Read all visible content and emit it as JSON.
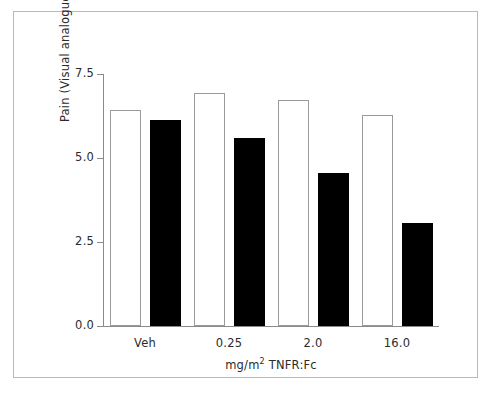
{
  "chart_data": {
    "type": "bar",
    "title": "",
    "subtitle": "",
    "xlabel_prefix": "mg/m",
    "xlabel_sup": "2",
    "xlabel_suffix": " TNFR:Fc",
    "xlabel": "mg/m2 TNFR:Fc",
    "ylabel": "Pain (Visual analogue)",
    "categories": [
      "Veh",
      "0.25",
      "2.0",
      "16.0"
    ],
    "ylim": [
      0.0,
      7.5
    ],
    "yticks": [
      0.0,
      2.5,
      5.0,
      7.5
    ],
    "ytick_labels": [
      "0.0",
      "2.5",
      "5.0",
      "7.5"
    ],
    "grid": false,
    "legend": "none",
    "series": [
      {
        "name": "open",
        "fill": "#ffffff",
        "edge": "#9a9a9a",
        "values": [
          6.43,
          6.93,
          6.73,
          6.28
        ]
      },
      {
        "name": "filled",
        "fill": "#000000",
        "edge": "#000000",
        "values": [
          6.13,
          5.6,
          4.55,
          3.07
        ]
      }
    ]
  },
  "figure": {
    "frame_color": "#b9b9b9",
    "axis_color": "#8a8a8a",
    "background": "#ffffff",
    "text_color": "#2b2b2b"
  }
}
